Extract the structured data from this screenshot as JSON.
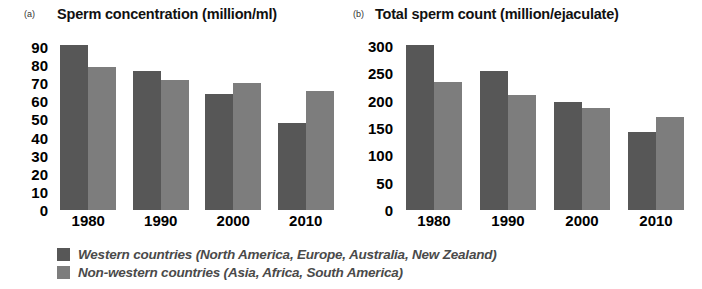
{
  "figure": {
    "background": "#ffffff",
    "colors": {
      "western": "#575757",
      "nonwestern": "#7d7d7d",
      "text": "#000000",
      "legend_text": "#4a4a4a"
    }
  },
  "panels": [
    {
      "letter": "(a)",
      "title": "Sperm concentration (million/ml)"
    },
    {
      "letter": "(b)",
      "title": "Total sperm count (million/ejaculate)"
    }
  ],
  "legend": {
    "items": [
      {
        "swatch": "western",
        "label": "Western countries (North America, Europe, Australia, New Zealand)"
      },
      {
        "swatch": "nonwestern",
        "label": "Non-western countries (Asia, Africa, South America)"
      }
    ]
  },
  "chart_data": [
    {
      "type": "bar",
      "title": "Sperm concentration (million/ml)",
      "panel": "(a)",
      "xlabel": "",
      "ylabel": "",
      "categories": [
        "1980",
        "1990",
        "2000",
        "2010"
      ],
      "series": [
        {
          "name": "Western countries (North America, Europe, Australia, New Zealand)",
          "color": "#575757",
          "values": [
            91,
            77,
            64,
            48
          ]
        },
        {
          "name": "Non-western countries (Asia, Africa, South America)",
          "color": "#7d7d7d",
          "values": [
            79,
            72,
            70,
            66
          ]
        }
      ],
      "ylim": [
        0,
        95
      ],
      "yticks": [
        0,
        10,
        20,
        30,
        40,
        50,
        60,
        70,
        80,
        90
      ],
      "ytick_labels": [
        "0",
        "10",
        "20",
        "30",
        "40",
        "50",
        "60",
        "70",
        "80",
        "90"
      ],
      "grid": false,
      "legend_position": "bottom"
    },
    {
      "type": "bar",
      "title": "Total sperm count (million/ejaculate)",
      "panel": "(b)",
      "xlabel": "",
      "ylabel": "",
      "categories": [
        "1980",
        "1990",
        "2000",
        "2010"
      ],
      "series": [
        {
          "name": "Western countries (North America, Europe, Australia, New Zealand)",
          "color": "#575757",
          "values": [
            302,
            254,
            197,
            143
          ]
        },
        {
          "name": "Non-western countries (Asia, Africa, South America)",
          "color": "#7d7d7d",
          "values": [
            235,
            211,
            186,
            170
          ]
        }
      ],
      "ylim": [
        0,
        315
      ],
      "yticks": [
        0,
        50,
        100,
        150,
        200,
        250,
        300
      ],
      "ytick_labels": [
        "0",
        "50",
        "100",
        "150",
        "200",
        "250",
        "300"
      ],
      "grid": false,
      "legend_position": "bottom"
    }
  ]
}
